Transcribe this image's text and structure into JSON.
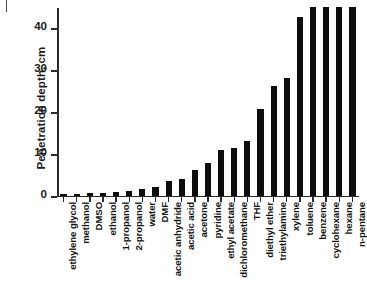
{
  "chart_data": {
    "type": "bar",
    "title": "",
    "xlabel": "",
    "ylabel": "Penetration depth, cm",
    "ylim": [
      0,
      45
    ],
    "yticks": [
      0,
      10,
      20,
      30,
      40
    ],
    "ytick_labels": [
      "0",
      "10",
      "20",
      "30",
      "40"
    ],
    "grid": false,
    "legend": "none",
    "bar_color": "#0d0d0d",
    "axis_color": "#2b2b2b",
    "categories": [
      "ethylene glycol",
      "methanol",
      "DMSO",
      "ethanol",
      "1-propanol",
      "2-propanol",
      "water",
      "DMF",
      "acetic anhydride",
      "acetic acid",
      "acetone",
      "pyridine",
      "ethyl acetate",
      "dichloromethane",
      "THF",
      "diethyl ether",
      "triethylamine",
      "xylene",
      "toluene",
      "benzene",
      "cyclohexane",
      "hexane",
      "n-pentane"
    ],
    "values": [
      0.2,
      0.4,
      0.5,
      0.7,
      0.9,
      1.1,
      1.5,
      2.0,
      3.4,
      4.0,
      6.0,
      7.8,
      10.8,
      11.4,
      12.9,
      20.6,
      26.1,
      28.0,
      42.5,
      45.0,
      45.0,
      45.0,
      45.0
    ]
  }
}
